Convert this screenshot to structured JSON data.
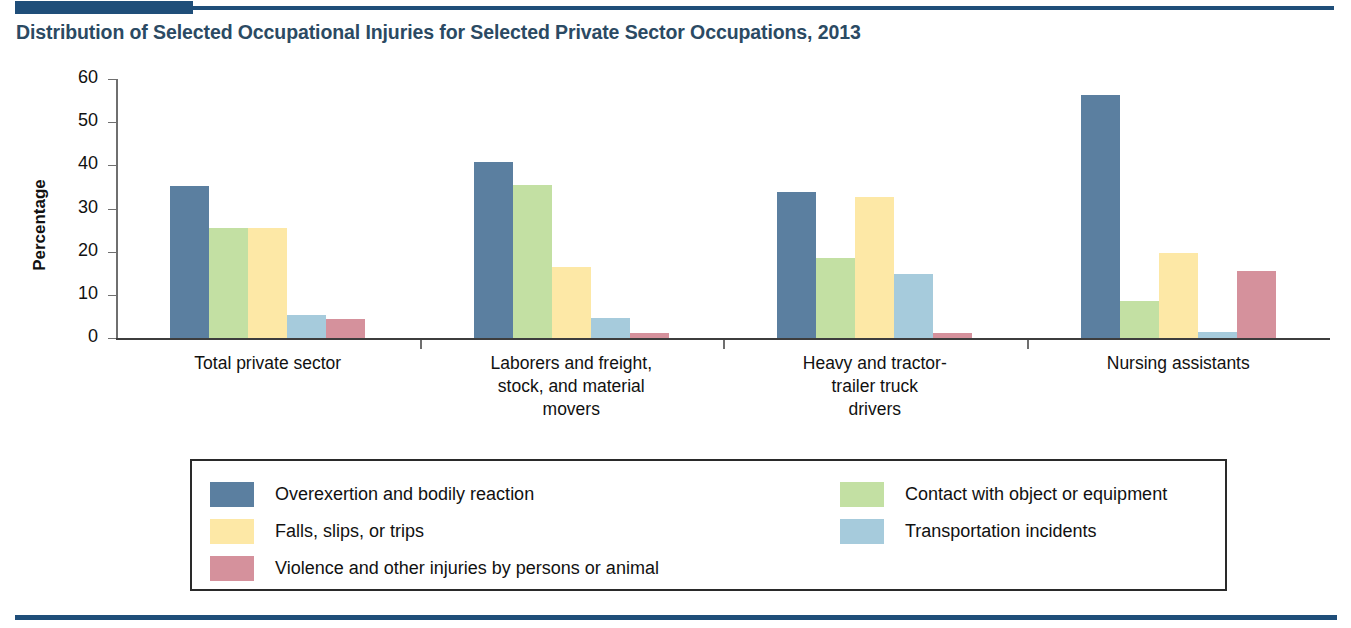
{
  "page_title": "Distribution of Selected Occupational Injuries for Selected Private Sector Occupations, 2013",
  "theme": {
    "rule_color": "#1f4e79",
    "title_color": "#2b4a63",
    "axis_color": "#3d3d3d"
  },
  "chart_data": {
    "type": "bar",
    "title": "Distribution of Selected Occupational Injuries for Selected Private Sector Occupations, 2013",
    "xlabel": "",
    "ylabel": "Percentage",
    "ylim": [
      0,
      60
    ],
    "yticks": [
      0,
      10,
      20,
      30,
      40,
      50,
      60
    ],
    "grid": false,
    "legend_position": "bottom",
    "categories": [
      "Total private sector",
      "Laborers and freight, stock, and material movers",
      "Heavy and tractor-trailer truck drivers",
      "Nursing assistants"
    ],
    "category_label_lines": [
      [
        "Total private sector"
      ],
      [
        "Laborers and freight,",
        "stock, and material",
        "movers"
      ],
      [
        "Heavy and tractor-",
        "trailer truck",
        "drivers"
      ],
      [
        "Nursing assistants"
      ]
    ],
    "series": [
      {
        "name": "Overexertion and bodily reaction",
        "color": "#5b7fa0",
        "values": [
          35.2,
          40.7,
          33.8,
          56.2
        ]
      },
      {
        "name": "Contact with object or equipment",
        "color": "#c3e0a3",
        "values": [
          25.6,
          35.5,
          18.5,
          8.6
        ]
      },
      {
        "name": "Falls, slips, or trips",
        "color": "#fde8a6",
        "values": [
          25.4,
          16.5,
          32.6,
          19.6
        ]
      },
      {
        "name": "Transportation incidents",
        "color": "#a6cbdc",
        "values": [
          5.3,
          4.6,
          14.8,
          1.5
        ]
      },
      {
        "name": "Violence and other injuries by persons or animal",
        "color": "#d5919c",
        "values": [
          4.5,
          1.1,
          1.2,
          15.6
        ]
      }
    ],
    "legend": {
      "left_column": [
        {
          "label": "Overexertion and bodily reaction",
          "color": "#5b7fa0"
        },
        {
          "label": "Falls, slips, or trips",
          "color": "#fde8a6"
        },
        {
          "label": "Violence and other injuries by persons or animal",
          "color": "#d5919c"
        }
      ],
      "right_column": [
        {
          "label": "Contact with object or equipment",
          "color": "#c3e0a3"
        },
        {
          "label": "Transportation incidents",
          "color": "#a6cbdc"
        }
      ]
    }
  }
}
